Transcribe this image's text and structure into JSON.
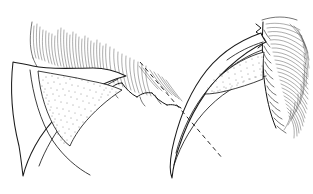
{
  "figure": {
    "background_color": "#ffffff",
    "ink_color": "#1b1b1b",
    "stipple_color": "#2b2b2b",
    "width": 313,
    "height": 194,
    "panel_count": 2,
    "caption": "",
    "labels": []
  },
  "panels": [
    {
      "id": "left-claw",
      "name": "left-claw-panel",
      "description": "Curved claw in lateral view with keratin sheath outline, stippled internal bony core and dorsal fur tuft",
      "claw": {
        "curvature": "strongly recurved",
        "tip_position": {
          "x": 22,
          "y": 176
        },
        "base_position": {
          "x": 110,
          "y": 78
        },
        "outer_arc_label": "",
        "inner_arc_label": "",
        "stipple_region": "ungual bony core",
        "stipple_density": 170
      },
      "fur": {
        "side": "dorsal",
        "stroke_count": 150,
        "description": "fur tuft sweeping to the right above the claw base"
      },
      "annotations": []
    },
    {
      "id": "right-claw",
      "name": "right-claw-panel",
      "description": "Curved claw in lateral view with sheath outline, stippled internal core, lateral fur mass and a dashed reference axis crossing the claw",
      "claw": {
        "curvature": "strongly recurved",
        "tip_position": {
          "x": 172,
          "y": 178
        },
        "base_position": {
          "x": 262,
          "y": 40
        },
        "outer_arc_label": "",
        "inner_arc_label": "",
        "stipple_region": "ungual bony core",
        "stipple_density": 160
      },
      "fur": {
        "side": "lateral right",
        "stroke_count": 170,
        "description": "dense fur mass against a dark vertical sheath boundary"
      },
      "annotations": [
        {
          "type": "dashed-line",
          "name": "reference-axis",
          "label": "",
          "start": {
            "x": 140,
            "y": 62
          },
          "end": {
            "x": 223,
            "y": 159
          },
          "style": "dashed",
          "dash_pattern": "4.5 3.5"
        }
      ]
    }
  ]
}
